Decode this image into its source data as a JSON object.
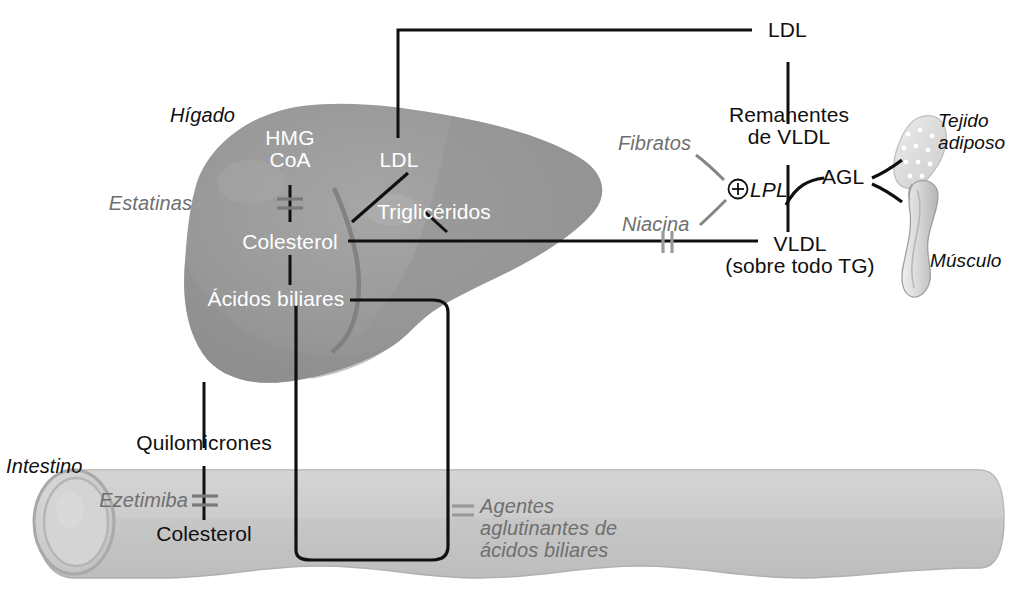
{
  "diagram": {
    "organs": [
      {
        "id": "liver",
        "label": "Hígado",
        "style": "italic-black"
      },
      {
        "id": "intestine",
        "label": "Intestino",
        "style": "italic-black"
      },
      {
        "id": "adipose",
        "label": "Tejido\nadiposo",
        "line1": "Tejido",
        "line2": "adiposo",
        "style": "italic-black"
      },
      {
        "id": "muscle",
        "label": "Músculo",
        "style": "italic-black"
      }
    ],
    "liver_nodes": [
      {
        "id": "hmgcoa",
        "line1": "HMG",
        "line2": "CoA"
      },
      {
        "id": "ldl_liver",
        "label": "LDL"
      },
      {
        "id": "trigliceridos",
        "label": "Triglicéridos"
      },
      {
        "id": "colesterol_h",
        "label": "Colesterol"
      },
      {
        "id": "acidos",
        "label": "Ácidos biliares"
      }
    ],
    "intestine_nodes": [
      {
        "id": "quilomicrones",
        "label": "Quilomicrones"
      },
      {
        "id": "colesterol_int",
        "label": "Colesterol"
      }
    ],
    "plasma_nodes": [
      {
        "id": "ldl_top",
        "label": "LDL"
      },
      {
        "id": "remanentes",
        "line1": "Remanentes",
        "line2": "de VLDL"
      },
      {
        "id": "lpl",
        "label": "LPL",
        "modifier": "⊕"
      },
      {
        "id": "agl",
        "label": "AGL"
      },
      {
        "id": "vldl",
        "line1": "VLDL",
        "line2": "(sobre todo TG)"
      }
    ],
    "drugs": [
      {
        "id": "estatinas",
        "label": "Estatinas",
        "action": "inhibit",
        "target": "HMG CoA → Colesterol"
      },
      {
        "id": "fibratos",
        "label": "Fibratos",
        "action": "stimulate",
        "target": "LPL"
      },
      {
        "id": "niacina",
        "label": "Niacina",
        "action": "inhibit",
        "target": "VLDL"
      },
      {
        "id": "ezetimiba",
        "label": "Ezetimiba",
        "action": "inhibit",
        "target": "Colesterol intestinal"
      },
      {
        "id": "resinas",
        "label": "Agentes aglutinantes de ácidos biliares",
        "line1": "Agentes",
        "line2": "aglutinantes de",
        "line3": "ácidos biliares",
        "action": "inhibit",
        "target": "Ácidos biliares"
      }
    ],
    "colors": {
      "liver_fill": "#9a9a9a",
      "liver_shade": "#8a8a8a",
      "intestine_fill": "#c6c6c6",
      "intestine_stroke": "#aaaaaa",
      "arrow_black": "#101010",
      "arrow_gray": "#808080",
      "drug_text": "#6f6f6f",
      "node_white": "#ffffff",
      "node_black": "#101010",
      "background": "#ffffff"
    }
  }
}
